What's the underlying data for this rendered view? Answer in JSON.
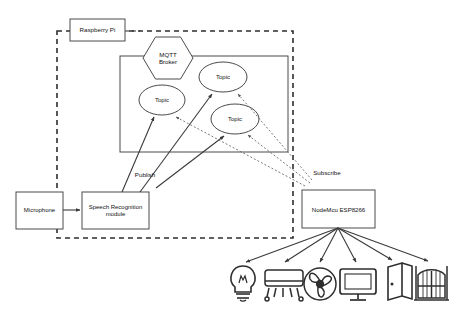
{
  "diagram": {
    "boundary": {
      "name": "raspberry-pi-boundary",
      "style": "dashed",
      "x": 57,
      "y": 31,
      "width": 236,
      "height": 207
    },
    "nodes": [
      {
        "id": "raspberry-pi",
        "label": "Raspberry Pi",
        "shape": "rect",
        "x": 70,
        "y": 19,
        "width": 55,
        "height": 22,
        "font_size": 6.2
      },
      {
        "id": "broker-container",
        "label": "",
        "shape": "rect",
        "x": 120,
        "y": 56,
        "width": 168,
        "height": 96,
        "font_size": 6
      },
      {
        "id": "mqtt-broker",
        "label": "MQTT\nBroker",
        "shape": "hexagon",
        "x": 143,
        "y": 37,
        "width": 50,
        "height": 42,
        "font_size": 6.2
      },
      {
        "id": "topic-1",
        "label": "Topic",
        "shape": "ellipse",
        "x": 139,
        "y": 85,
        "width": 46,
        "height": 30,
        "font_size": 6
      },
      {
        "id": "topic-2",
        "label": "Topic",
        "shape": "ellipse",
        "x": 199,
        "y": 62,
        "width": 48,
        "height": 30,
        "font_size": 6
      },
      {
        "id": "topic-3",
        "label": "Topic",
        "shape": "ellipse",
        "x": 211,
        "y": 104,
        "width": 48,
        "height": 30,
        "font_size": 6
      },
      {
        "id": "microphone",
        "label": "Microphone",
        "shape": "rect",
        "x": 16,
        "y": 192,
        "width": 47,
        "height": 37,
        "font_size": 6
      },
      {
        "id": "speech-recognition-module",
        "label": "Speech Recognition\nmodule",
        "shape": "rect",
        "x": 82,
        "y": 192,
        "width": 67,
        "height": 37,
        "font_size": 6
      },
      {
        "id": "nodemcu-esp8266",
        "label": "NodeMcu ESP8266",
        "shape": "rect",
        "x": 302,
        "y": 190,
        "width": 73,
        "height": 38,
        "font_size": 6.1
      }
    ],
    "edge_labels": [
      {
        "id": "publish-label",
        "text": "Publish",
        "x": 128,
        "y": 170,
        "font_size": 6.2
      },
      {
        "id": "subscribe-label",
        "text": "Subscribe",
        "x": 306,
        "y": 168,
        "font_size": 6.2
      }
    ],
    "edges": [
      {
        "from": "microphone",
        "to": "speech-recognition-module",
        "style": "solid",
        "label": ""
      },
      {
        "from": "speech-recognition-module",
        "to": "topic-1",
        "style": "solid",
        "label": "Publish"
      },
      {
        "from": "speech-recognition-module",
        "to": "topic-2",
        "style": "solid",
        "label": "Publish"
      },
      {
        "from": "speech-recognition-module",
        "to": "topic-3",
        "style": "solid",
        "label": "Publish"
      },
      {
        "from": "nodemcu-esp8266",
        "to": "topic-1",
        "style": "dotted",
        "label": "Subscribe"
      },
      {
        "from": "nodemcu-esp8266",
        "to": "topic-2",
        "style": "dotted",
        "label": "Subscribe"
      },
      {
        "from": "nodemcu-esp8266",
        "to": "topic-3",
        "style": "dotted",
        "label": "Subscribe"
      },
      {
        "from": "raspberry-pi",
        "to": "raspberry-pi-boundary",
        "style": "dashed",
        "label": ""
      }
    ],
    "devices": [
      {
        "id": "light-bulb",
        "icon": "light-bulb-icon",
        "cx": 243,
        "cy": 285
      },
      {
        "id": "air-conditioner",
        "icon": "air-conditioner-icon",
        "cx": 283,
        "cy": 285
      },
      {
        "id": "ceiling-fan",
        "icon": "fan-icon",
        "cx": 320,
        "cy": 285
      },
      {
        "id": "television",
        "icon": "monitor-icon",
        "cx": 358,
        "cy": 285
      },
      {
        "id": "door",
        "icon": "door-icon",
        "cx": 396,
        "cy": 284
      },
      {
        "id": "gate",
        "icon": "gate-icon",
        "cx": 431,
        "cy": 284
      }
    ],
    "colors": {
      "stroke": "#3a3a3a",
      "device_stroke": "#2e2e2e",
      "text": "#111111",
      "background": "#ffffff"
    }
  }
}
